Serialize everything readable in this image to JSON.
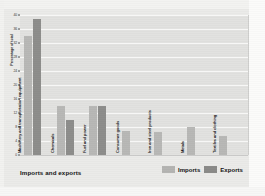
{
  "chart_data": {
    "type": "bar",
    "title": "Imports and exports",
    "xlabel": "",
    "ylabel": "Percentage of total",
    "ylim": [
      0,
      40
    ],
    "yticks": [
      0,
      4,
      8,
      12,
      16,
      20,
      24,
      28,
      32,
      36,
      40
    ],
    "grid": true,
    "legend_position": "bottom-right",
    "categories": [
      "Machinery and transportation equipment",
      "Chemicals",
      "Fuel and power",
      "Consumer goods",
      "Iron and steel products",
      "Metals",
      "Textiles and clothing"
    ],
    "series": [
      {
        "name": "Imports",
        "color": "#b8b8b6",
        "values": [
          34,
          14,
          14,
          7,
          6.5,
          8,
          5.5
        ]
      },
      {
        "name": "Exports",
        "color": "#8d8d8b",
        "values": [
          39,
          10,
          14,
          null,
          null,
          null,
          null
        ]
      }
    ]
  },
  "legend": {
    "items": [
      {
        "label": "Imports",
        "color": "#b4b4b2"
      },
      {
        "label": "Exports",
        "color": "#8a8a88"
      }
    ]
  }
}
